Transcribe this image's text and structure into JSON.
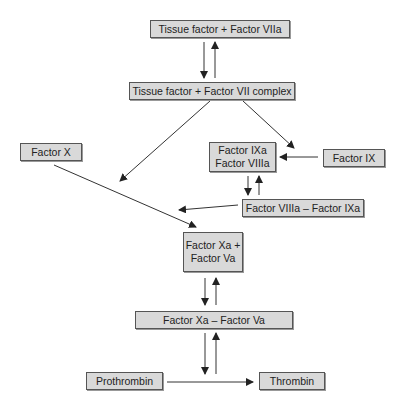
{
  "diagram": {
    "nodes": {
      "tf_viia": "Tissue factor + Factor VIIa",
      "tf_vii_complex": "Tissue factor + Factor VII complex",
      "factor_x": "Factor X",
      "factor_ixa_viiia_line1": "Factor IXa",
      "factor_ixa_viiia_line2": "Factor VIIIa",
      "factor_ix": "Factor IX",
      "viiia_ixa": "Factor VIIIa – Factor IXa",
      "xa_va_line1": "Factor Xa +",
      "xa_va_line2": "Factor Va",
      "xa_va_complex": "Factor Xa – Factor Va",
      "prothrombin": "Prothrombin",
      "thrombin": "Thrombin"
    },
    "edges": [
      {
        "from": "tf_viia",
        "to": "tf_vii_complex",
        "type": "reversible"
      },
      {
        "from": "tf_vii_complex",
        "to": "factor_x_path",
        "type": "activates"
      },
      {
        "from": "tf_vii_complex",
        "to": "factor_ixa_viiia",
        "type": "activates"
      },
      {
        "from": "factor_ix",
        "to": "factor_ixa_viiia",
        "type": "conversion"
      },
      {
        "from": "factor_ixa_viiia",
        "to": "viiia_ixa",
        "type": "reversible"
      },
      {
        "from": "viiia_ixa",
        "to": "factor_x_path",
        "type": "activates"
      },
      {
        "from": "factor_x",
        "to": "xa_va",
        "type": "conversion"
      },
      {
        "from": "xa_va",
        "to": "xa_va_complex",
        "type": "reversible"
      },
      {
        "from": "xa_va_complex",
        "to": "prothrombin_path",
        "type": "reversible"
      },
      {
        "from": "prothrombin",
        "to": "thrombin",
        "type": "conversion"
      }
    ]
  }
}
